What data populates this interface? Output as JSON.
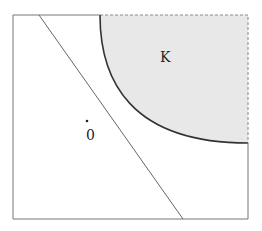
{
  "diagram": {
    "frame": {
      "x": 13,
      "y": 15,
      "width": 235,
      "height": 204,
      "stroke": "#777777"
    },
    "line": {
      "x1": 39,
      "y1": 15,
      "x2": 183,
      "y2": 219,
      "stroke": "#666666"
    },
    "region": {
      "label": "K",
      "fill": "#e8e8e8",
      "boundary_stroke": "#333333",
      "dashed_stroke": "#888888"
    },
    "origin": {
      "label": "0",
      "dot_x": 87,
      "dot_y": 121
    }
  }
}
